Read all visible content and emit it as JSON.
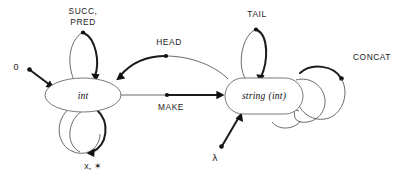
{
  "diagram": {
    "background_color": "#ffffff",
    "line_color": "#59595b",
    "accent_color": "#111111",
    "nodes": [
      {
        "id": "int",
        "label": "int",
        "shape": "ellipse"
      },
      {
        "id": "string",
        "label_main": "string",
        "label_arg": "(int)",
        "shape": "rounded-rect"
      }
    ],
    "labels": {
      "succ_pred_line1": "SUCC,",
      "succ_pred_line2": "PRED",
      "zero": "0",
      "times_star": "x, ✶",
      "head": "HEAD",
      "make": "MAKE",
      "tail": "TAIL",
      "concat": "CONCAT",
      "lambda": "λ"
    },
    "edges": [
      {
        "name": "succ-pred-loop",
        "from": "int",
        "to": "int",
        "label": "SUCC, PRED",
        "position": "top"
      },
      {
        "name": "times-star-loop",
        "from": "int",
        "to": "int",
        "label": "x, ✶",
        "position": "bottom",
        "count": 2
      },
      {
        "name": "zero-constant",
        "from": "0",
        "to": "int",
        "label": "0",
        "position": "left"
      },
      {
        "name": "head-edge",
        "from": "string",
        "to": "int",
        "label": "HEAD",
        "position": "upper-middle"
      },
      {
        "name": "make-edge",
        "from": "int",
        "to": "string",
        "label": "MAKE",
        "position": "middle"
      },
      {
        "name": "tail-loop",
        "from": "string",
        "to": "string",
        "label": "TAIL",
        "position": "top"
      },
      {
        "name": "concat-loop",
        "from": "string",
        "to": "string",
        "label": "CONCAT",
        "position": "right",
        "count": 2
      },
      {
        "name": "lambda-constant",
        "from": "λ",
        "to": "string",
        "label": "λ",
        "position": "bottom-left"
      }
    ]
  }
}
